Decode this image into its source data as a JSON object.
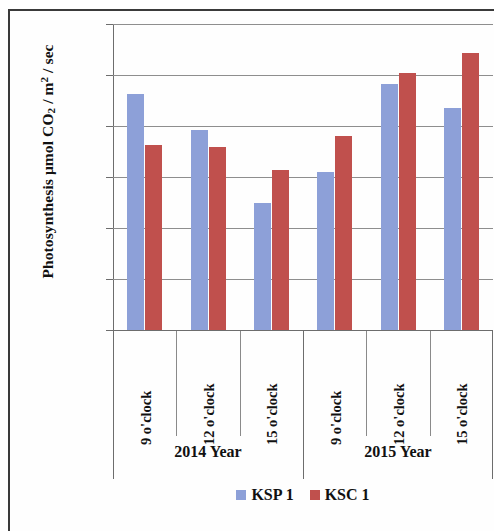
{
  "chart_data": {
    "type": "bar",
    "title": "",
    "subtitle": "",
    "xlabel": "",
    "ylabel": "Photosynthesis μmol CO2 / m2 / sec",
    "ylabel_parts": {
      "prefix": "Photosynthesis μmol CO",
      "sub1": "2",
      "mid": " / m",
      "sup1": "2",
      "suffix": " / sec"
    },
    "ylim": [
      0,
      30
    ],
    "ytick_step": 5,
    "ytick_labels": [
      "30",
      "25",
      "20",
      "15",
      "10",
      "5",
      "0"
    ],
    "ytick_values": [
      30,
      25,
      20,
      15,
      10,
      5,
      0
    ],
    "grid": true,
    "grid_axis": "y",
    "legend_position": "bottom-center",
    "categories": [
      "9 o'clock",
      "12 o'clock",
      "15 o'clock",
      "9 o'clock",
      "12 o'clock",
      "15 o'clock"
    ],
    "groups": [
      {
        "label": "2014 Year",
        "categories": [
          "9 o'clock",
          "12 o'clock",
          "15 o'clock"
        ]
      },
      {
        "label": "2015 Year",
        "categories": [
          "9 o'clock",
          "12 o'clock",
          "15 o'clock"
        ]
      }
    ],
    "series": [
      {
        "name": "KSP 1",
        "color": "#8da0d8",
        "values": [
          23.1,
          19.6,
          12.5,
          15.5,
          24.1,
          21.8
        ]
      },
      {
        "name": "KSC 1",
        "color": "#c0504d",
        "values": [
          18.1,
          17.9,
          15.7,
          19.0,
          25.2,
          27.2
        ]
      }
    ]
  },
  "legend": {
    "entries": [
      {
        "label": "KSP 1",
        "color": "#8da0d8"
      },
      {
        "label": "KSC 1",
        "color": "#c0504d"
      }
    ]
  },
  "colors": {
    "series_ksp": "#8da0d8",
    "series_ksc": "#c0504d",
    "axis": "#6d6d6d",
    "grid": "#8e8e8e",
    "text": "#111111",
    "frame": "#3a3a3a",
    "background": "#fefefe"
  }
}
